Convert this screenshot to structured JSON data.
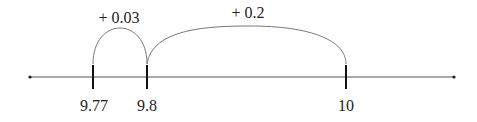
{
  "diagram": {
    "type": "number-line",
    "axis": {
      "x_start": 30,
      "x_end": 454,
      "y": 77,
      "color": "#555555"
    },
    "ticks": [
      {
        "value": 9.77,
        "label": "9.77",
        "x": 93
      },
      {
        "value": 9.8,
        "label": "9.8",
        "x": 147
      },
      {
        "value": 10,
        "label": "10",
        "x": 346
      }
    ],
    "jumps": [
      {
        "from": "9.77",
        "to": "9.8",
        "label": "+ 0.03"
      },
      {
        "from": "9.8",
        "to": "10",
        "label": "+ 0.2"
      }
    ]
  }
}
